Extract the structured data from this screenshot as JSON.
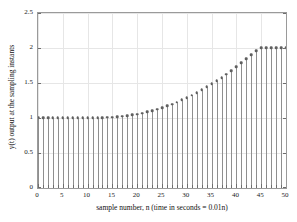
{
  "chart_data": {
    "type": "line",
    "plot_style": "stem",
    "title": "",
    "xlabel": "sample number, n (time in seconds = 0.01n)",
    "ylabel": "y(t) output at the sampling instants",
    "xlim": [
      0,
      50
    ],
    "ylim": [
      0,
      2.5
    ],
    "grid": true,
    "legend": null,
    "xticks": [
      0,
      5,
      10,
      15,
      20,
      25,
      30,
      35,
      40,
      45,
      50
    ],
    "xticklabels": [
      "0",
      "5",
      "10",
      "15",
      "20",
      "25",
      "30",
      "35",
      "40",
      "45",
      "50"
    ],
    "yticks": [
      0,
      0.5,
      1,
      1.5,
      2,
      2.5
    ],
    "yticklabels": [
      "0",
      "0.5",
      "1",
      "1.5",
      "2",
      "2.5"
    ],
    "x_minor_tick_step": 1,
    "marker": "circle",
    "marker_color": "#5f5f5f",
    "stem_color": "#8f8f8f",
    "grid_color": "#e6e6e6",
    "axes_color": "#9a9a9a",
    "x": [
      0,
      1,
      2,
      3,
      4,
      5,
      6,
      7,
      8,
      9,
      10,
      11,
      12,
      13,
      14,
      15,
      16,
      17,
      18,
      19,
      20,
      21,
      22,
      23,
      24,
      25,
      26,
      27,
      28,
      29,
      30,
      31,
      32,
      33,
      34,
      35,
      36,
      37,
      38,
      39,
      40,
      41,
      42,
      43,
      44,
      45,
      46,
      47,
      48,
      49,
      50
    ],
    "values": [
      1.0,
      1.0,
      1.0,
      1.0,
      1.0,
      1.0,
      1.0,
      1.0,
      1.0,
      1.0,
      1.0,
      1.0,
      1.0,
      1.005,
      1.008,
      1.012,
      1.018,
      1.025,
      1.033,
      1.043,
      1.055,
      1.07,
      1.086,
      1.104,
      1.124,
      1.147,
      1.171,
      1.198,
      1.227,
      1.258,
      1.291,
      1.326,
      1.363,
      1.402,
      1.443,
      1.486,
      1.531,
      1.578,
      1.627,
      1.678,
      1.731,
      1.786,
      1.843,
      1.902,
      1.963,
      2.0,
      2.0,
      2.0,
      2.0,
      2.0,
      2.0
    ]
  }
}
